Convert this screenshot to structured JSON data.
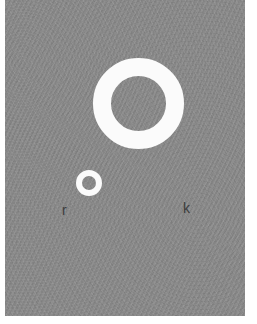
{
  "figure": {
    "canvas": {
      "background_color": "#8b8b8b",
      "margin_color": "#ffffff",
      "texture": "fine diagonal weave grain",
      "width_px": 257,
      "height_px": 324
    },
    "shapes": [
      {
        "id": "ring-large",
        "kind": "ring",
        "color": "#fbfbfb",
        "center_x": 139,
        "center_y": 104,
        "outer_diameter_px": 91,
        "stroke_px": 18,
        "label": "k"
      },
      {
        "id": "ring-small",
        "kind": "ring",
        "color": "#fbfbfb",
        "center_x": 89,
        "center_y": 183,
        "outer_diameter_px": 26,
        "stroke_px": 6,
        "label": "r"
      }
    ],
    "labels": {
      "small_ring_label": "r",
      "large_ring_label": "k",
      "label_color": "#3c3c3c"
    }
  }
}
